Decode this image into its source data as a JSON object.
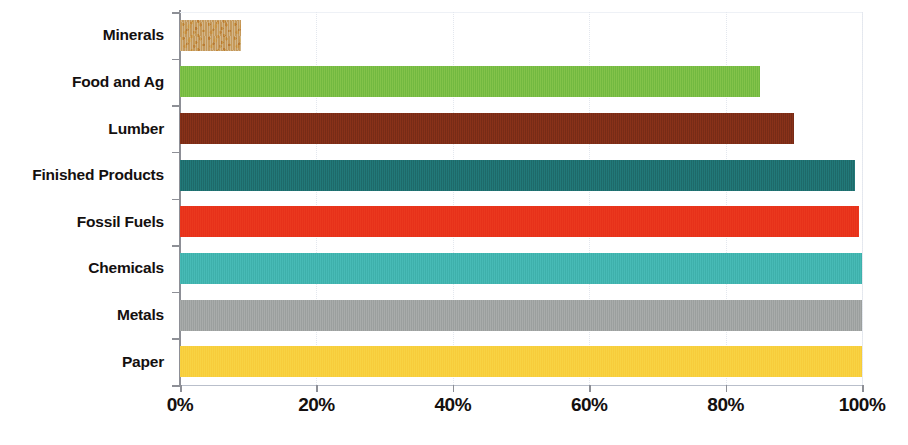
{
  "chart_data": {
    "type": "bar",
    "orientation": "horizontal",
    "title": "",
    "subtitle": "",
    "xlabel": "",
    "ylabel": "",
    "xlim": [
      0,
      100
    ],
    "xtick_labels": [
      "0%",
      "20%",
      "40%",
      "60%",
      "80%",
      "100%"
    ],
    "xtick_values": [
      0,
      20,
      40,
      60,
      80,
      100
    ],
    "grid": true,
    "grid_axis": "x",
    "legend": "none",
    "unit": "%",
    "categories": [
      "Minerals",
      "Food and Ag",
      "Lumber",
      "Finished Products",
      "Fossil Fuels",
      "Chemicals",
      "Metals",
      "Paper"
    ],
    "values": [
      9,
      85,
      90,
      99,
      99.5,
      100,
      100,
      100
    ],
    "bars": [
      {
        "label": "Minerals",
        "value": 9,
        "color": "#c6a271",
        "texture": "speckled-sand"
      },
      {
        "label": "Food and Ag",
        "value": 85,
        "color": "#77bc43",
        "texture": "vertical-hatch"
      },
      {
        "label": "Lumber",
        "value": 90,
        "color": "#7c2d17",
        "texture": "vertical-hatch"
      },
      {
        "label": "Finished Products",
        "value": 99,
        "color": "#1f6e6e",
        "texture": "vertical-hatch"
      },
      {
        "label": "Fossil Fuels",
        "value": 99.5,
        "color": "#e8331b",
        "texture": "vertical-hatch"
      },
      {
        "label": "Chemicals",
        "value": 100,
        "color": "#41b3ae",
        "texture": "vertical-hatch"
      },
      {
        "label": "Metals",
        "value": 100,
        "color": "#9fa3a2",
        "texture": "vertical-hatch"
      },
      {
        "label": "Paper",
        "value": 100,
        "color": "#f7ce3d",
        "texture": "vertical-hatch"
      }
    ],
    "axis_color": "#8d8f96",
    "grid_color": "#e3e7ee",
    "background": "#ffffff",
    "text_color": "#14100f"
  }
}
